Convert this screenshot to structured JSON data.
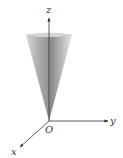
{
  "figure": {
    "type": "3d-cone-diagram",
    "axes": {
      "x_label": "x",
      "y_label": "y",
      "z_label": "z",
      "origin_label": "O"
    },
    "colors": {
      "axis": "#333333",
      "cone_dark": "#8a8a8a",
      "cone_light": "#e6e6e6"
    }
  }
}
